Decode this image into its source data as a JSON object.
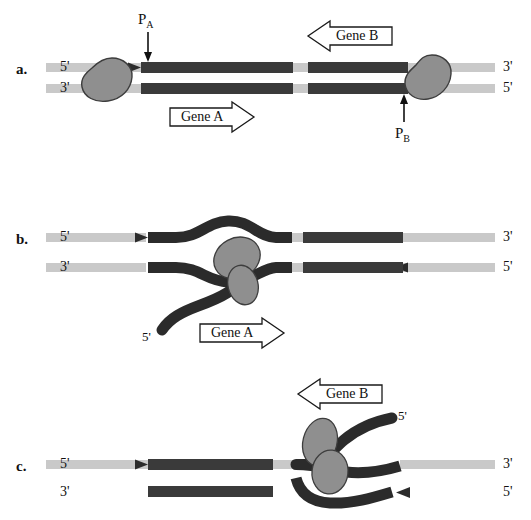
{
  "figure": {
    "colors": {
      "background": "#ffffff",
      "dna_backbone_light": "#c9c9c9",
      "dna_coding_dark": "#3a3a3a",
      "rna_transcript": "#2b2b2b",
      "polymerase_fill": "#8f8f8f",
      "polymerase_stroke": "#3d3d3d",
      "text": "#111111",
      "arrow_outline": "#1a1a1a"
    }
  },
  "panels": [
    {
      "id": "panel-a",
      "letter": "a.",
      "strand_labels": {
        "top_left": "5'",
        "bottom_left": "3'",
        "top_right": "3'",
        "bottom_right": "5'"
      },
      "promoters": [
        {
          "name": "P_A",
          "base": "P",
          "subscript": "A",
          "arrow_direction": "down"
        },
        {
          "name": "P_B",
          "base": "P",
          "subscript": "B",
          "arrow_direction": "up"
        }
      ],
      "gene_arrows": [
        {
          "label": "Gene A",
          "direction": "right"
        },
        {
          "label": "Gene B",
          "direction": "left"
        }
      ],
      "polymerase_count": 2,
      "rna_transcripts": 0
    },
    {
      "id": "panel-b",
      "letter": "b.",
      "strand_labels": {
        "top_left": "5'",
        "bottom_left": "3'",
        "top_right": "3'",
        "bottom_right": "5'"
      },
      "gene_arrows": [
        {
          "label": "Gene A",
          "direction": "right"
        }
      ],
      "rna_end_label": "5'",
      "polymerase_count": 1,
      "rna_transcripts": 1
    },
    {
      "id": "panel-c",
      "letter": "c.",
      "strand_labels": {
        "top_left": "5'",
        "bottom_left": "3'",
        "top_right": "3'",
        "bottom_right": "5'"
      },
      "gene_arrows": [
        {
          "label": "Gene B",
          "direction": "left"
        }
      ],
      "rna_end_label": "5'",
      "polymerase_count": 1,
      "rna_transcripts": 1
    }
  ]
}
